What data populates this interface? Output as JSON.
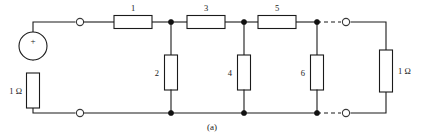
{
  "figure": {
    "caption": "(a)",
    "type": "electrical-circuit-schematic"
  },
  "source": {
    "polarity_label": "+",
    "symbol": "voltage-source"
  },
  "resistors": {
    "series_top": [
      {
        "id": "R1",
        "label": "1",
        "orientation": "horizontal"
      },
      {
        "id": "R3",
        "label": "3",
        "orientation": "horizontal"
      },
      {
        "id": "R5",
        "label": "5",
        "orientation": "horizontal"
      }
    ],
    "shunt": [
      {
        "id": "R2",
        "label": "2",
        "orientation": "vertical"
      },
      {
        "id": "R4",
        "label": "4",
        "orientation": "vertical"
      },
      {
        "id": "R6",
        "label": "6",
        "orientation": "vertical"
      }
    ],
    "source_resistance": {
      "id": "Rs",
      "label": "1 Ω",
      "orientation": "vertical"
    },
    "load_resistance": {
      "id": "RL",
      "label": "1 Ω",
      "orientation": "vertical"
    }
  },
  "colors": {
    "wire": "#1a1a1a",
    "background": "#ffffff",
    "node": "#111111",
    "box_fill": "#ffffff"
  }
}
